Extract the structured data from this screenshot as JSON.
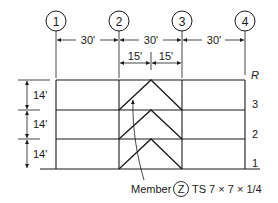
{
  "diagram": {
    "type": "braced-frame-elevation",
    "gridlines": [
      {
        "id": "1",
        "label": "1"
      },
      {
        "id": "2",
        "label": "2"
      },
      {
        "id": "3",
        "label": "3"
      },
      {
        "id": "4",
        "label": "4"
      }
    ],
    "bay_dimensions": [
      "30'",
      "30'",
      "30'"
    ],
    "half_bay_dimensions": [
      "15'",
      "15'"
    ],
    "story_heights": [
      "14'",
      "14'",
      "14'"
    ],
    "levels": [
      "R",
      "3",
      "2",
      "1"
    ],
    "caption": {
      "prefix": "Member",
      "tag": "Z",
      "section": "TS 7 × 7 × 1/4"
    }
  }
}
